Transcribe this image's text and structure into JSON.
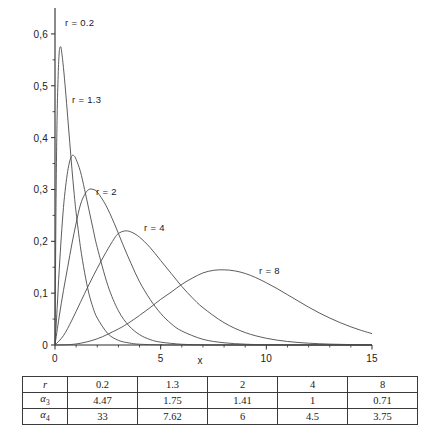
{
  "chart_data": {
    "type": "line",
    "title": "",
    "xlabel": "x",
    "ylabel": "",
    "xlim": [
      0,
      15
    ],
    "ylim": [
      0,
      0.65
    ],
    "grid": false,
    "legend_position": "inline-annotations",
    "x_ticks": [
      "0",
      "5",
      "10",
      "15"
    ],
    "x_tick_values": [
      0,
      5,
      10,
      15
    ],
    "y_ticks": [
      "0",
      "0,1",
      "0,2",
      "0,3",
      "0,4",
      "0,5",
      "0,6"
    ],
    "y_tick_values": [
      0,
      0.1,
      0.2,
      0.3,
      0.4,
      0.5,
      0.6
    ],
    "series": [
      {
        "name": "r = 0.2",
        "label": "r = 0.2",
        "peak_x": 0.25,
        "peak_y": 0.575,
        "values": [
          [
            0,
            0
          ],
          [
            0.05,
            0.28
          ],
          [
            0.1,
            0.44
          ],
          [
            0.15,
            0.52
          ],
          [
            0.2,
            0.565
          ],
          [
            0.25,
            0.575
          ],
          [
            0.3,
            0.57
          ],
          [
            0.4,
            0.535
          ],
          [
            0.5,
            0.49
          ],
          [
            0.6,
            0.44
          ],
          [
            0.7,
            0.39
          ],
          [
            0.8,
            0.34
          ],
          [
            0.9,
            0.295
          ],
          [
            1.0,
            0.255
          ],
          [
            1.2,
            0.19
          ],
          [
            1.4,
            0.14
          ],
          [
            1.6,
            0.1
          ],
          [
            1.8,
            0.072
          ],
          [
            2.0,
            0.052
          ],
          [
            2.5,
            0.022
          ],
          [
            3.0,
            0.009
          ],
          [
            3.5,
            0.004
          ],
          [
            4.0,
            0.0015
          ],
          [
            5.0,
            0.0003
          ],
          [
            6.0,
            0.0001
          ],
          [
            15,
            0
          ]
        ]
      },
      {
        "name": "r = 1.3",
        "label": "r = 1.3",
        "peak_x": 0.8,
        "peak_y": 0.365,
        "values": [
          [
            0,
            0
          ],
          [
            0.1,
            0.07
          ],
          [
            0.2,
            0.145
          ],
          [
            0.3,
            0.21
          ],
          [
            0.4,
            0.265
          ],
          [
            0.5,
            0.305
          ],
          [
            0.6,
            0.335
          ],
          [
            0.7,
            0.355
          ],
          [
            0.8,
            0.365
          ],
          [
            0.9,
            0.365
          ],
          [
            1.0,
            0.358
          ],
          [
            1.2,
            0.335
          ],
          [
            1.4,
            0.3
          ],
          [
            1.6,
            0.262
          ],
          [
            1.8,
            0.224
          ],
          [
            2.0,
            0.188
          ],
          [
            2.5,
            0.115
          ],
          [
            3.0,
            0.066
          ],
          [
            3.5,
            0.037
          ],
          [
            4.0,
            0.02
          ],
          [
            4.5,
            0.0105
          ],
          [
            5.0,
            0.0055
          ],
          [
            6.0,
            0.0014
          ],
          [
            7.0,
            0.0003
          ],
          [
            8.0,
            0.0001
          ],
          [
            15,
            0
          ]
        ]
      },
      {
        "name": "r = 2",
        "label": "r = 2",
        "peak_x": 1.4,
        "peak_y": 0.3,
        "values": [
          [
            0,
            0
          ],
          [
            0.2,
            0.055
          ],
          [
            0.4,
            0.105
          ],
          [
            0.6,
            0.15
          ],
          [
            0.8,
            0.195
          ],
          [
            1.0,
            0.235
          ],
          [
            1.2,
            0.27
          ],
          [
            1.4,
            0.29
          ],
          [
            1.6,
            0.3
          ],
          [
            1.8,
            0.3
          ],
          [
            2.0,
            0.295
          ],
          [
            2.4,
            0.27
          ],
          [
            2.8,
            0.235
          ],
          [
            3.2,
            0.195
          ],
          [
            3.6,
            0.157
          ],
          [
            4.0,
            0.122
          ],
          [
            4.5,
            0.088
          ],
          [
            5.0,
            0.061
          ],
          [
            5.5,
            0.041
          ],
          [
            6.0,
            0.027
          ],
          [
            7.0,
            0.011
          ],
          [
            8.0,
            0.0043
          ],
          [
            9.0,
            0.0016
          ],
          [
            10.0,
            0.0006
          ],
          [
            12,
            0.0001
          ],
          [
            15,
            0
          ]
        ]
      },
      {
        "name": "r = 4",
        "label": "r = 4",
        "peak_x": 3.0,
        "peak_y": 0.22,
        "values": [
          [
            0,
            0
          ],
          [
            0.4,
            0.018
          ],
          [
            0.8,
            0.048
          ],
          [
            1.2,
            0.082
          ],
          [
            1.6,
            0.116
          ],
          [
            2.0,
            0.148
          ],
          [
            2.4,
            0.178
          ],
          [
            2.8,
            0.205
          ],
          [
            3.0,
            0.215
          ],
          [
            3.3,
            0.22
          ],
          [
            3.6,
            0.218
          ],
          [
            4.0,
            0.208
          ],
          [
            4.5,
            0.188
          ],
          [
            5.0,
            0.163
          ],
          [
            5.5,
            0.138
          ],
          [
            6.0,
            0.113
          ],
          [
            6.5,
            0.091
          ],
          [
            7.0,
            0.072
          ],
          [
            8.0,
            0.043
          ],
          [
            9.0,
            0.024
          ],
          [
            10.0,
            0.013
          ],
          [
            11.0,
            0.0068
          ],
          [
            12.0,
            0.0035
          ],
          [
            13.0,
            0.0017
          ],
          [
            14.0,
            0.0008
          ],
          [
            15,
            0.0004
          ]
        ]
      },
      {
        "name": "r = 8",
        "label": "r = 8",
        "peak_x": 7.0,
        "peak_y": 0.145,
        "values": [
          [
            0,
            0
          ],
          [
            1.0,
            0.002
          ],
          [
            2.0,
            0.012
          ],
          [
            3.0,
            0.031
          ],
          [
            3.5,
            0.043
          ],
          [
            4.0,
            0.057
          ],
          [
            4.5,
            0.072
          ],
          [
            5.0,
            0.088
          ],
          [
            5.5,
            0.102
          ],
          [
            6.0,
            0.117
          ],
          [
            6.5,
            0.129
          ],
          [
            7.0,
            0.139
          ],
          [
            7.5,
            0.144
          ],
          [
            8.0,
            0.145
          ],
          [
            8.5,
            0.143
          ],
          [
            9.0,
            0.138
          ],
          [
            9.5,
            0.13
          ],
          [
            10.0,
            0.12
          ],
          [
            10.5,
            0.109
          ],
          [
            11.0,
            0.097
          ],
          [
            11.5,
            0.085
          ],
          [
            12.0,
            0.073
          ],
          [
            12.5,
            0.062
          ],
          [
            13.0,
            0.052
          ],
          [
            13.5,
            0.043
          ],
          [
            14.0,
            0.035
          ],
          [
            14.5,
            0.028
          ],
          [
            15.0,
            0.022
          ]
        ]
      }
    ]
  },
  "axis": {
    "x_title": "x",
    "y_ticks": [
      {
        "label": "0,6",
        "value": 0.6
      },
      {
        "label": "0,5",
        "value": 0.5
      },
      {
        "label": "0,4",
        "value": 0.4
      },
      {
        "label": "0,3",
        "value": 0.3
      },
      {
        "label": "0,2",
        "value": 0.2
      },
      {
        "label": "0,1",
        "value": 0.1
      },
      {
        "label": "0",
        "value": 0
      }
    ],
    "x_ticks": [
      {
        "label": "0",
        "value": 0
      },
      {
        "label": "5",
        "value": 5
      },
      {
        "label": "10",
        "value": 10
      },
      {
        "label": "15",
        "value": 15
      }
    ]
  },
  "annotations": [
    {
      "text": "r = 0.2",
      "x": 65,
      "y": 17
    },
    {
      "text": "r = 1.3",
      "x": 72,
      "y": 94
    },
    {
      "text": "r = 2",
      "x": 96,
      "y": 186
    },
    {
      "text": "r = 4",
      "x": 144,
      "y": 222
    },
    {
      "text": "r = 8",
      "x": 259,
      "y": 265
    }
  ],
  "table": {
    "rows": [
      {
        "header": "r",
        "header_sub": "",
        "cells": [
          "0.2",
          "1.3",
          "2",
          "4",
          "8"
        ]
      },
      {
        "header": "α",
        "header_sub": "3",
        "cells": [
          "4.47",
          "1.75",
          "1.41",
          "1",
          "0.71"
        ]
      },
      {
        "header": "α",
        "header_sub": "4",
        "cells": [
          "33",
          "7.62",
          "6",
          "4.5",
          "3.75"
        ]
      }
    ]
  },
  "colors": {
    "curve": "#4a4a4a",
    "axis": "#2b2b2b",
    "text": "#1a1a1a",
    "table_border": "#3a3a3a",
    "background": "#ffffff"
  }
}
